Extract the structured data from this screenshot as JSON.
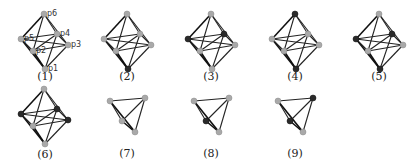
{
  "figure": {
    "colors": {
      "light_node": "#a9a9a9",
      "dark_node": "#2a2a2a",
      "edge": "#222222"
    },
    "octahedron_geometry": {
      "vertices": {
        "p6": [
          0,
          -31
        ],
        "p5": [
          -23,
          -6
        ],
        "p4": [
          13,
          -11
        ],
        "p2": [
          -11,
          6
        ],
        "p3": [
          24,
          0
        ],
        "p1": [
          1,
          24
        ]
      },
      "edges": [
        [
          "p6",
          "p5"
        ],
        [
          "p6",
          "p4"
        ],
        [
          "p6",
          "p2"
        ],
        [
          "p6",
          "p3"
        ],
        [
          "p1",
          "p5"
        ],
        [
          "p1",
          "p4"
        ],
        [
          "p1",
          "p2"
        ],
        [
          "p1",
          "p3"
        ],
        [
          "p5",
          "p4"
        ],
        [
          "p5",
          "p2"
        ],
        [
          "p2",
          "p3"
        ],
        [
          "p4",
          "p3"
        ],
        [
          "p5",
          "p3"
        ],
        [
          "p2",
          "p4"
        ]
      ],
      "bold_edges": [
        [
          "p6",
          "p5"
        ],
        [
          "p5",
          "p1"
        ],
        [
          "p2",
          "p1"
        ]
      ]
    },
    "tetrahedron_geometry": {
      "vertices": {
        "a": [
          -17,
          -5
        ],
        "b": [
          18,
          -8
        ],
        "c": [
          -5,
          15
        ],
        "d": [
          8,
          26
        ]
      },
      "edges": [
        [
          "a",
          "b"
        ],
        [
          "a",
          "c"
        ],
        [
          "a",
          "d"
        ],
        [
          "b",
          "c"
        ],
        [
          "b",
          "d"
        ],
        [
          "c",
          "d"
        ]
      ],
      "bold_edges": [
        [
          "a",
          "d"
        ],
        [
          "c",
          "d"
        ]
      ]
    },
    "panels": [
      {
        "caption": "(1)",
        "type": "octahedron",
        "origin": [
          44,
          45
        ],
        "caption_pos": [
          45,
          80
        ],
        "dark": [],
        "show_labels": true,
        "vertex_labels": {
          "p6": "p6",
          "p5": "p5",
          "p4": "p4",
          "p2": "p2",
          "p3": "p3",
          "p1": "p1"
        }
      },
      {
        "caption": "(2)",
        "type": "octahedron",
        "origin": [
          127,
          45
        ],
        "caption_pos": [
          127,
          80
        ],
        "dark": [
          "p1"
        ]
      },
      {
        "caption": "(3)",
        "type": "octahedron",
        "origin": [
          211,
          45
        ],
        "caption_pos": [
          211,
          80
        ],
        "dark": [
          "p5",
          "p4"
        ]
      },
      {
        "caption": "(4)",
        "type": "octahedron",
        "origin": [
          295,
          45
        ],
        "caption_pos": [
          295,
          80
        ],
        "dark": [
          "p6",
          "p1"
        ]
      },
      {
        "caption": "(5)",
        "type": "octahedron",
        "origin": [
          379,
          45
        ],
        "caption_pos": [
          379,
          80
        ],
        "dark": [
          "p5",
          "p4",
          "p1"
        ]
      },
      {
        "caption": "(6)",
        "type": "octahedron",
        "origin": [
          44,
          120
        ],
        "caption_pos": [
          45,
          158
        ],
        "dark": [
          "p5",
          "p4",
          "p3"
        ]
      },
      {
        "caption": "(7)",
        "type": "tetrahedron",
        "origin": [
          127,
          106
        ],
        "caption_pos": [
          127,
          157
        ],
        "dark": []
      },
      {
        "caption": "(8)",
        "type": "tetrahedron",
        "origin": [
          211,
          106
        ],
        "caption_pos": [
          211,
          157
        ],
        "dark": [
          "c"
        ]
      },
      {
        "caption": "(9)",
        "type": "tetrahedron",
        "origin": [
          295,
          106
        ],
        "caption_pos": [
          295,
          157
        ],
        "dark": [
          "b",
          "c"
        ]
      }
    ]
  }
}
